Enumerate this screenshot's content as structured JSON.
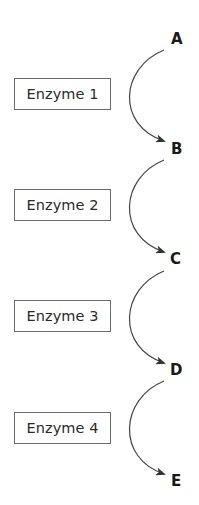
{
  "diagram": {
    "type": "metabolic-pathway",
    "metabolites": [
      {
        "label": "A"
      },
      {
        "label": "B"
      },
      {
        "label": "C"
      },
      {
        "label": "D"
      },
      {
        "label": "E"
      }
    ],
    "enzymes": [
      {
        "label": "Enzyme 1",
        "from": "A",
        "to": "B"
      },
      {
        "label": "Enzyme 2",
        "from": "B",
        "to": "C"
      },
      {
        "label": "Enzyme 3",
        "from": "C",
        "to": "D"
      },
      {
        "label": "Enzyme 4",
        "from": "D",
        "to": "E"
      }
    ],
    "colors": {
      "background": "#ffffff",
      "text": "#1a1a1a",
      "box_border": "#6b6b6b",
      "arrow": "#333333"
    }
  }
}
